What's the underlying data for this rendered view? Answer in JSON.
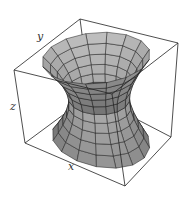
{
  "figure": {
    "type": "3d-surface-plot",
    "surface": "hyperboloid of one sheet",
    "equation": "x^2 + y^2 - z^2 = 1",
    "axis_labels": {
      "x": "x",
      "y": "y",
      "z": "z"
    },
    "mesh": {
      "u_divisions": 16,
      "v_divisions": 10
    },
    "colors": {
      "surface_light": "#c8c8c8",
      "surface_dark": "#3c3c3c",
      "grid": "#1a1a1a",
      "box": "#222222",
      "background": "#ffffff"
    },
    "box_corners_px": {
      "top_back_left": [
        80,
        19
      ],
      "top_back_right": [
        178,
        43
      ],
      "top_front_left": [
        14,
        70
      ],
      "top_front_right": [
        112,
        94
      ],
      "bottom_back_left": [
        90,
        95
      ],
      "bottom_back_right": [
        171,
        137
      ],
      "bottom_front_left": [
        25,
        143
      ],
      "bottom_front_right": [
        125,
        186
      ]
    }
  }
}
